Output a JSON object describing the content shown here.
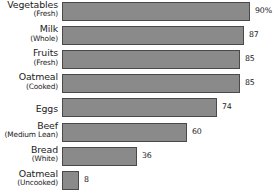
{
  "chart_data": {
    "type": "bar",
    "orientation": "horizontal",
    "title": "",
    "subtitle": "",
    "xlabel": "",
    "ylabel": "",
    "grid": false,
    "legend": null,
    "axis_visible": false,
    "xlim": [
      0,
      100
    ],
    "categories": [
      "Vegetables (Fresh)",
      "Milk (Whole)",
      "Fruits (Fresh)",
      "Oatmeal (Cooked)",
      "Eggs",
      "Beef (Medium Lean)",
      "Bread (White)",
      "Oatmeal (Uncooked)"
    ],
    "values": [
      90,
      87,
      85,
      85,
      74,
      60,
      36,
      8
    ],
    "value_labels": [
      "90%",
      "87",
      "85",
      "85",
      "74",
      "60",
      "36",
      "8"
    ],
    "bar_color": "#8a8a8a",
    "bar_border_color": "#4a4a4a",
    "background_color": "#ffffff",
    "text_color": "#1b1b1b"
  },
  "rows": [
    {
      "label_main": "Vegetables",
      "label_sub": "(Fresh)",
      "value": 90,
      "value_label": "90%"
    },
    {
      "label_main": "Milk",
      "label_sub": "(Whole)",
      "value": 87,
      "value_label": "87"
    },
    {
      "label_main": "Fruits",
      "label_sub": "(Fresh)",
      "value": 85,
      "value_label": "85"
    },
    {
      "label_main": "Oatmeal",
      "label_sub": "(Cooked)",
      "value": 85,
      "value_label": "85"
    },
    {
      "label_main": "Eggs",
      "label_sub": "",
      "value": 74,
      "value_label": "74"
    },
    {
      "label_main": "Beef",
      "label_sub": "(Medium Lean)",
      "value": 60,
      "value_label": "60"
    },
    {
      "label_main": "Bread",
      "label_sub": "(White)",
      "value": 36,
      "value_label": "36"
    },
    {
      "label_main": "Oatmeal",
      "label_sub": "(Uncooked)",
      "value": 8,
      "value_label": "8"
    }
  ]
}
